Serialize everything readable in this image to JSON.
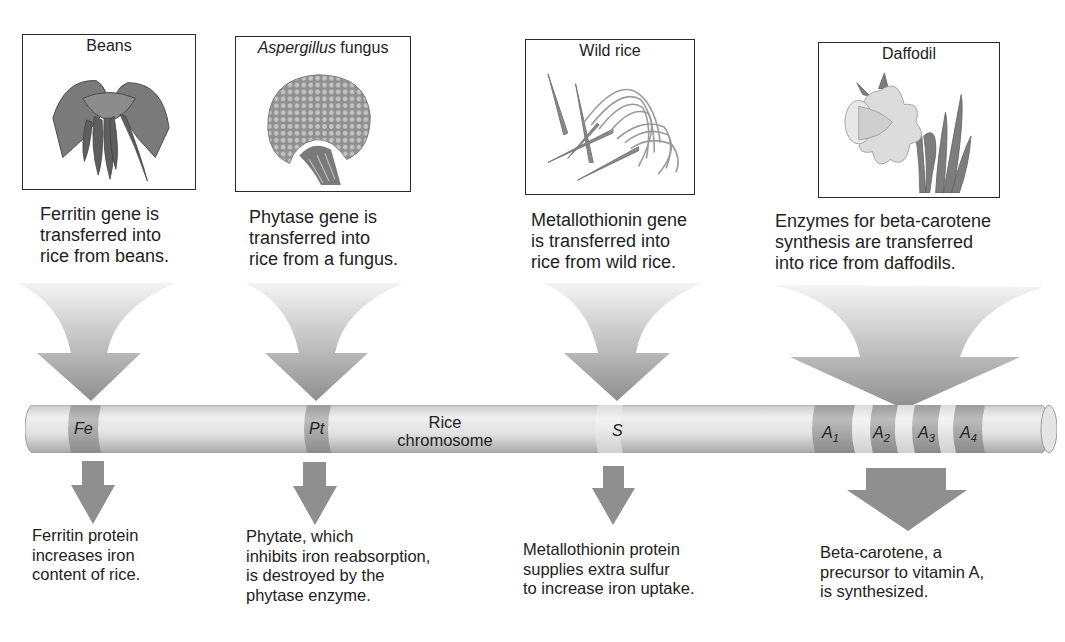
{
  "diagram": {
    "chromosome_label": "Rice\nchromosome",
    "sources": [
      {
        "id": "beans",
        "title": "Beans",
        "title_italic": "",
        "title_plain": "Beans",
        "illustration": "beans-plant-icon",
        "description": "Ferritin gene is\ntransferred into\nrice from beans.",
        "gene_label": "Fe",
        "result": "Ferritin protein\nincreases iron\ncontent of rice."
      },
      {
        "id": "aspergillus",
        "title": "Aspergillus fungus",
        "title_italic": "Aspergillus",
        "title_plain": " fungus",
        "illustration": "aspergillus-fungus-icon",
        "description": "Phytase gene is\ntransferred into\nrice from a fungus.",
        "gene_label": "Pt",
        "result": "Phytate, which\ninhibits iron reabsorption,\nis destroyed by the\nphytase enzyme."
      },
      {
        "id": "wild-rice",
        "title": "Wild rice",
        "title_italic": "",
        "title_plain": "Wild rice",
        "illustration": "wild-rice-plant-icon",
        "description": "Metallothionin gene\nis transferred into\nrice from wild rice.",
        "gene_label": "S",
        "result": "Metallothionin protein\nsupplies extra sulfur\nto increase iron uptake."
      },
      {
        "id": "daffodil",
        "title": "Daffodil",
        "title_italic": "",
        "title_plain": "Daffodil",
        "illustration": "daffodil-flower-icon",
        "description": "Enzymes for beta-carotene\nsynthesis are transferred\ninto rice from daffodils.",
        "gene_labels": [
          {
            "base": "A",
            "sub": "1"
          },
          {
            "base": "A",
            "sub": "2"
          },
          {
            "base": "A",
            "sub": "3"
          },
          {
            "base": "A",
            "sub": "4"
          }
        ],
        "result": "Beta-carotene, a\nprecursor to vitamin A,\nis synthesized."
      }
    ],
    "colors": {
      "box_border": "#2a2a2a",
      "arrow_light": "#eeeeee",
      "arrow_dark": "#8f8f8f",
      "chromosome_body": "#d9d9d9",
      "gene_band_dark": "#a8a8a8",
      "gene_band_light": "#ececec",
      "text": "#222222"
    }
  }
}
